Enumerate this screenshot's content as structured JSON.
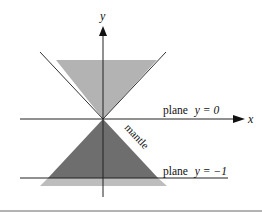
{
  "diagram": {
    "axes": {
      "x_label": "x",
      "y_label": "y"
    },
    "labels": {
      "plane_top": "plane  y = 0",
      "plane_top_prefix": "plane",
      "plane_top_eq": "y = 0",
      "plane_bottom": "plane  y = −1",
      "plane_bottom_prefix": "plane",
      "plane_bottom_eq": "y = −1",
      "mantle": "mantle"
    },
    "colors": {
      "upper_cone_fill": "#b3b3b3",
      "lower_cone_fill": "#6e6e6e",
      "lower_band_fill": "#bdbdbd",
      "line": "#222222",
      "separator": "#9a9a9a"
    }
  }
}
